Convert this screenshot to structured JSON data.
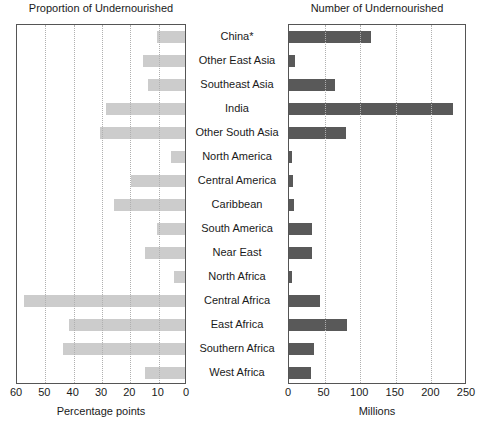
{
  "chart_data": [
    {
      "type": "bar",
      "orientation": "horizontal",
      "title": "Proportion of Undernourished",
      "xlabel": "Percentage points",
      "ylabel": "",
      "xlim": [
        60,
        0
      ],
      "reversed_axis": true,
      "xticks": [
        60,
        50,
        40,
        30,
        20,
        10,
        0
      ],
      "grid": true,
      "bar_color": "#cccccc",
      "categories": [
        "China*",
        "Other East Asia",
        "Southeast Asia",
        "India",
        "Other South Asia",
        "North America",
        "Central America",
        "Caribbean",
        "South America",
        "Near East",
        "North Africa",
        "Central Africa",
        "East Africa",
        "Southern Africa",
        "West Africa"
      ],
      "values": [
        10,
        15,
        13,
        28,
        30,
        5,
        19,
        25,
        10,
        14,
        4,
        57,
        41,
        43,
        14
      ]
    },
    {
      "type": "bar",
      "orientation": "horizontal",
      "title": "Number of Undernourished",
      "xlabel": "Millions",
      "ylabel": "",
      "xlim": [
        0,
        250
      ],
      "reversed_axis": false,
      "xticks": [
        0,
        50,
        100,
        150,
        200,
        250
      ],
      "grid": true,
      "bar_color": "#595959",
      "categories": [
        "China*",
        "Other East Asia",
        "Southeast Asia",
        "India",
        "Other South Asia",
        "North America",
        "Central America",
        "Caribbean",
        "South America",
        "Near East",
        "North Africa",
        "Central Africa",
        "East Africa",
        "Southern Africa",
        "West Africa"
      ],
      "values": [
        115,
        8,
        65,
        230,
        80,
        4,
        6,
        7,
        33,
        32,
        4,
        43,
        82,
        35,
        31
      ]
    }
  ],
  "left": {
    "title": "Proportion of Undernourished",
    "xlabel": "Percentage points",
    "ticks": [
      "60",
      "50",
      "40",
      "30",
      "20",
      "10",
      "0"
    ]
  },
  "right": {
    "title": "Number of Undernourished",
    "xlabel": "Millions",
    "ticks": [
      "0",
      "50",
      "100",
      "150",
      "200",
      "250"
    ]
  },
  "categories": [
    "China*",
    "Other East Asia",
    "Southeast Asia",
    "India",
    "Other South Asia",
    "North America",
    "Central America",
    "Caribbean",
    "South America",
    "Near East",
    "North Africa",
    "Central Africa",
    "East Africa",
    "Southern Africa",
    "West Africa"
  ]
}
